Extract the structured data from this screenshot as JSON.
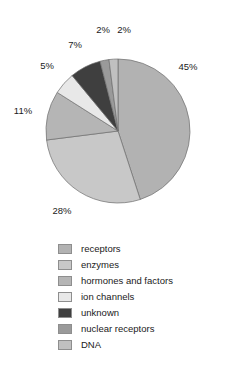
{
  "chart_data": {
    "type": "pie",
    "title": "",
    "subtitle": "",
    "xlabel": "",
    "ylabel": "",
    "grid": false,
    "legend_position": "bottom",
    "start_angle_deg": 0,
    "direction": "clockwise",
    "categories": [
      "receptors",
      "enzymes",
      "hormones and factors",
      "ion channels",
      "unknown",
      "nuclear receptors",
      "DNA"
    ],
    "values": [
      45,
      28,
      11,
      5,
      7,
      2,
      2
    ],
    "value_labels": [
      "45%",
      "28%",
      "11%",
      "5%",
      "7%",
      "2%",
      "2%"
    ],
    "colors": [
      "#b2b2b2",
      "#c8c8c8",
      "#b5b5b5",
      "#e8e8e8",
      "#3f3f3f",
      "#9a9a9a",
      "#c0c0c0"
    ],
    "slices": [
      {
        "label": "receptors",
        "value": 45,
        "value_label": "45%",
        "color": "#b2b2b2",
        "label_x": 188,
        "label_y": 70
      },
      {
        "label": "enzymes",
        "value": 28,
        "value_label": "28%",
        "color": "#c8c8c8",
        "label_x": 62,
        "label_y": 214
      },
      {
        "label": "hormones and factors",
        "value": 11,
        "value_label": "11%",
        "color": "#b5b5b5",
        "label_x": 23,
        "label_y": 114
      },
      {
        "label": "ion channels",
        "value": 5,
        "value_label": "5%",
        "color": "#e8e8e8",
        "label_x": 47,
        "label_y": 69
      },
      {
        "label": "unknown",
        "value": 7,
        "value_label": "7%",
        "color": "#3f3f3f",
        "label_x": 75,
        "label_y": 48
      },
      {
        "label": "nuclear receptors",
        "value": 2,
        "value_label": "2%",
        "color": "#9a9a9a",
        "label_x": 103,
        "label_y": 33
      },
      {
        "label": "DNA",
        "value": 2,
        "value_label": "2%",
        "color": "#c0c0c0",
        "label_x": 124,
        "label_y": 33
      }
    ],
    "geometry": {
      "cx": 118,
      "cy": 131,
      "r": 72
    }
  },
  "legend": {
    "items": [
      {
        "label": "receptors",
        "color": "#b2b2b2"
      },
      {
        "label": "enzymes",
        "color": "#c8c8c8"
      },
      {
        "label": "hormones and factors",
        "color": "#b5b5b5"
      },
      {
        "label": "ion channels",
        "color": "#e8e8e8"
      },
      {
        "label": "unknown",
        "color": "#3f3f3f"
      },
      {
        "label": "nuclear receptors",
        "color": "#9a9a9a"
      },
      {
        "label": "DNA",
        "color": "#c0c0c0"
      }
    ]
  }
}
